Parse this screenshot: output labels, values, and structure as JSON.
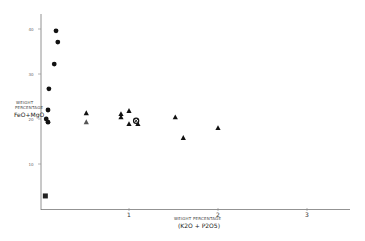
{
  "chart_data": {
    "type": "scatter",
    "title": "",
    "xlabel": "WEIGHT PERCENTAGE",
    "xlabel_sub": "(K2O + P2O5)",
    "ylabel_line1": "WEIGHT",
    "ylabel_line2": "PERCENTAGE",
    "ylabel_line3": "FeO+MgO",
    "xlim": [
      0,
      3.5
    ],
    "ylim": [
      0,
      42
    ],
    "xticks": [
      1,
      2,
      3
    ],
    "xtick_labels": [
      "1",
      "2",
      "3"
    ],
    "yticks": [
      10,
      20,
      30,
      40
    ],
    "ytick_labels": [
      "10",
      "20",
      "30",
      "40"
    ],
    "grid": false,
    "legend": "none",
    "series": [
      {
        "name": "filled-circles",
        "marker": "circle",
        "points": [
          {
            "x": 0.18,
            "y": 39.6
          },
          {
            "x": 0.2,
            "y": 37.1
          },
          {
            "x": 0.16,
            "y": 32.2
          },
          {
            "x": 0.1,
            "y": 26.7
          },
          {
            "x": 0.09,
            "y": 22.0
          },
          {
            "x": 0.07,
            "y": 20.0
          },
          {
            "x": 0.09,
            "y": 19.3
          }
        ]
      },
      {
        "name": "filled-square",
        "marker": "square",
        "points": [
          {
            "x": 0.06,
            "y": 2.9
          }
        ]
      },
      {
        "name": "filled-triangles",
        "marker": "triangle",
        "points": [
          {
            "x": 0.52,
            "y": 21.3
          },
          {
            "x": 0.91,
            "y": 21.1
          },
          {
            "x": 0.91,
            "y": 20.4
          },
          {
            "x": 1.0,
            "y": 21.8
          },
          {
            "x": 1.0,
            "y": 18.9
          },
          {
            "x": 1.1,
            "y": 18.9
          },
          {
            "x": 1.52,
            "y": 20.4
          },
          {
            "x": 1.61,
            "y": 15.8
          },
          {
            "x": 2.0,
            "y": 18.0
          }
        ]
      },
      {
        "name": "light-triangles",
        "marker": "triangle-light",
        "points": [
          {
            "x": 0.52,
            "y": 19.3
          }
        ]
      },
      {
        "name": "crossed-circle",
        "marker": "circle-cross",
        "points": [
          {
            "x": 1.08,
            "y": 19.6
          }
        ]
      }
    ]
  }
}
